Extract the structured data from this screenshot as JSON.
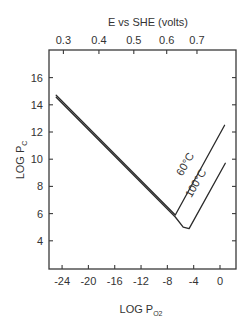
{
  "chart_data": {
    "type": "line",
    "title": "",
    "xlabel": "LOG Po2",
    "xlabel_main": "LOG P",
    "xlabel_sub": "O2",
    "ylabel": "LOG Pc",
    "ylabel_main": "LOG P",
    "ylabel_sub": "C",
    "top_xlabel": "E vs SHE (volts)",
    "xlim": [
      -26,
      2.4
    ],
    "ylim": [
      2,
      17.5
    ],
    "x_ticks": [
      -24,
      -20,
      -16,
      -12,
      -8,
      -4,
      0
    ],
    "x_tick_labels": [
      "-24",
      "-20",
      "-16",
      "-12",
      "-8",
      "-4",
      "0"
    ],
    "y_ticks": [
      4,
      6,
      8,
      10,
      12,
      14,
      16
    ],
    "y_tick_labels": [
      "4",
      "6",
      "8",
      "10",
      "12",
      "14",
      "16"
    ],
    "top_x_ticks_pos": [
      -23.8,
      -18.4,
      -13.1,
      -8.1,
      -3.5
    ],
    "top_x_tick_labels": [
      "0.3",
      "0.4",
      "0.5",
      "0.6",
      "0.7"
    ],
    "grid": false,
    "legend": "inline labels on curves",
    "series": [
      {
        "name": "60°C",
        "points": [
          [
            -24.9,
            14.7
          ],
          [
            -6.8,
            5.9
          ],
          [
            0.7,
            12.5
          ]
        ]
      },
      {
        "name": "100°C",
        "points": [
          [
            -24.9,
            14.55
          ],
          [
            -6.8,
            5.75
          ],
          [
            -5.6,
            5.0
          ],
          [
            -4.7,
            4.9
          ],
          [
            0.8,
            9.7
          ]
        ]
      }
    ],
    "annotations": [
      {
        "text": "60°C",
        "x": -4.8,
        "y": 9.5,
        "rotation": -60
      },
      {
        "text": "100°C",
        "x": -3.2,
        "y": 8.1,
        "rotation": -60
      }
    ]
  }
}
